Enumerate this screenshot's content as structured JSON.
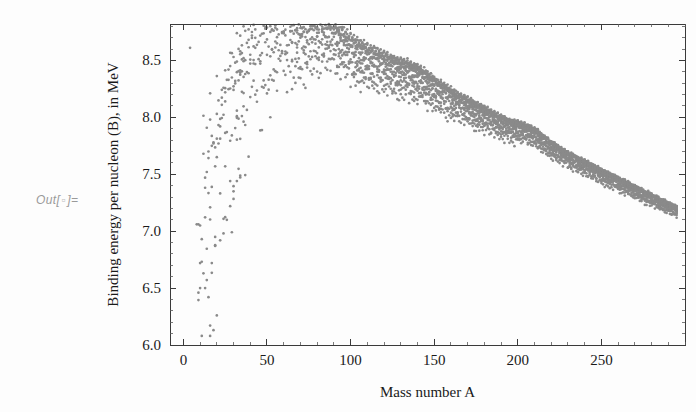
{
  "notebook": {
    "prompt_prefix": "Out[",
    "prompt_index": "▫",
    "prompt_suffix": "]="
  },
  "chart_data": {
    "type": "scatter",
    "title": "",
    "xlabel": "Mass number A",
    "ylabel": "Binding energy per nucleon (B), in MeV",
    "xlim": [
      -8,
      300
    ],
    "ylim": [
      6.0,
      8.82
    ],
    "xticks": [
      0,
      50,
      100,
      150,
      200,
      250
    ],
    "xtick_labels": [
      "0",
      "50",
      "100",
      "150",
      "200",
      "250"
    ],
    "yticks": [
      6.0,
      6.5,
      7.0,
      7.5,
      8.0,
      8.5
    ],
    "ytick_labels": [
      "6.0",
      "6.5",
      "7.0",
      "7.5",
      "8.0",
      "8.5"
    ],
    "x_minor_step": 10,
    "y_minor_step": 0.1,
    "grid": false,
    "legend": null,
    "point_color": "#8a8a8a",
    "point_radius": 1.35,
    "frame": true,
    "peak": {
      "A": 58,
      "B": 8.79
    },
    "endpoint": {
      "A": 295,
      "B": 7.05
    },
    "series": [
      {
        "name": "nuclides",
        "generator": "semf",
        "semf_coefficients": {
          "a_volume": 15.76,
          "a_surface": 17.81,
          "a_coulomb": 0.711,
          "a_asymmetry": 23.702,
          "a_pairing": 34.0
        },
        "A_min": 4,
        "A_max": 295,
        "stability_band_halfwidth": 6.5,
        "shell_bumps": [
          {
            "A": 56,
            "dB": 0.1,
            "width": 9
          },
          {
            "A": 88,
            "dB": 0.075,
            "width": 10
          },
          {
            "A": 140,
            "dB": 0.045,
            "width": 12
          },
          {
            "A": 208,
            "dB": 0.055,
            "width": 11
          }
        ]
      }
    ]
  }
}
